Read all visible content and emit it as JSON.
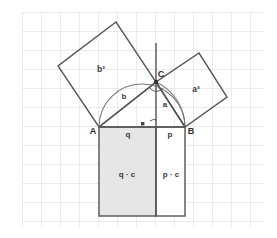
{
  "figure": {
    "background_color": "#ffffff",
    "grid": {
      "color": "#d8d8d8",
      "spacing": 19,
      "origin_x": 22,
      "origin_y": 12,
      "visible": true
    },
    "stroke_color": "#555555",
    "shade_color": "#e3e3e3"
  },
  "points": {
    "A": {
      "label": "A",
      "x": 99,
      "y": 127
    },
    "B": {
      "label": "B",
      "x": 185,
      "y": 127
    },
    "C": {
      "label": "C",
      "x": 156,
      "y": 82
    },
    "H": {
      "label": "",
      "x": 156,
      "y": 127
    }
  },
  "labels": {
    "square_b": "b²",
    "square_a": "a²",
    "side_b": "b",
    "side_a": "a",
    "segment_q": "q",
    "segment_p": "p",
    "rect_qc": "q · c",
    "rect_pc": "p · c",
    "point_a": "A",
    "point_b": "B",
    "point_c": "C"
  },
  "shapes": {
    "triangle": {
      "name": "right-triangle-ABC",
      "vertices": "99,127 185,127 156,82",
      "right_angle_at": "C"
    },
    "square_b": {
      "name": "square-on-side-b",
      "vertices": "99,127 156,82 116,22 58,66",
      "filled": false
    },
    "square_a": {
      "name": "square-on-side-a",
      "vertices": "156,82 185,127 227,97 199,53",
      "filled": false
    },
    "rect_qc": {
      "name": "rectangle-q-times-c",
      "x": 99,
      "y": 127,
      "width": 57,
      "height": 89,
      "filled": true
    },
    "rect_pc": {
      "name": "rectangle-p-times-c",
      "x": 156,
      "y": 127,
      "width": 29,
      "height": 89,
      "filled": false
    },
    "semicircle_AB": {
      "name": "thales-semicircle-over-AB",
      "cx": 142,
      "cy": 127,
      "r": 43
    },
    "arc_CB": {
      "name": "arc-from-C-to-B",
      "start": "156,82",
      "end": "185,127",
      "r": 55
    }
  },
  "markers": {
    "right_angle_C": "right-angle-marker-at-C",
    "right_angle_foot": "right-angle-marker-at-altitude-foot",
    "altitude": "altitude-line-from-C"
  }
}
